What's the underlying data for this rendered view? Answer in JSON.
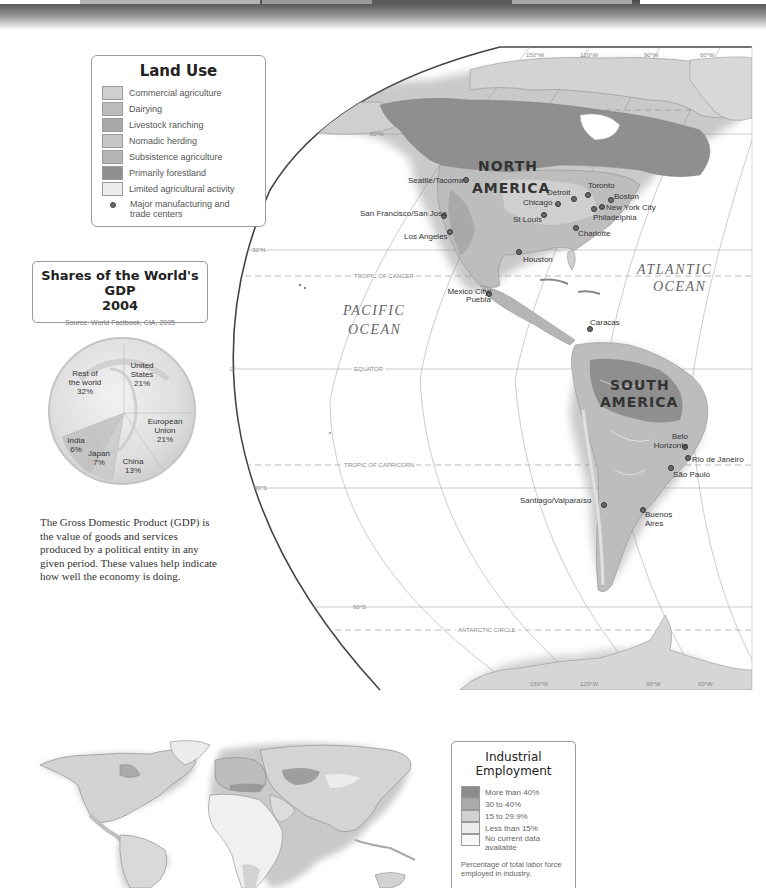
{
  "page": {
    "theme_colors": {
      "commercial_agriculture": "#cfcfcf",
      "dairying": "#bdbdbd",
      "livestock_ranching": "#a9a9a9",
      "nomadic_herding": "#c6c6c6",
      "subsistence_agriculture": "#b5b5b5",
      "primarily_forestland": "#8f8f8f",
      "limited_agricultural_activity": "#ececec",
      "city_marker": "#6b6b6b"
    }
  },
  "land_use_legend": {
    "title": "Land Use",
    "items": [
      {
        "label": "Commercial agriculture",
        "color": "#cfcfcf"
      },
      {
        "label": "Dairying",
        "color": "#bdbdbd"
      },
      {
        "label": "Livestock ranching",
        "color": "#a9a9a9"
      },
      {
        "label": "Nomadic herding",
        "color": "#c6c6c6"
      },
      {
        "label": "Subsistence agriculture",
        "color": "#b5b5b5"
      },
      {
        "label": "Primarily forestland",
        "color": "#8f8f8f"
      },
      {
        "label": "Limited agricultural activity",
        "color": "#ececec"
      }
    ],
    "marker_label": "Major manufacturing and trade centers"
  },
  "gdp": {
    "title_line1": "Shares of the World's GDP",
    "title_line2": "2004",
    "source": "Source: World Factbook, CIA, 2005",
    "paragraph": "The Gross Domestic Product (GDP) is the value of goods and services produced by a political entity in any given period. These values help indicate how well the economy is doing.",
    "slices": [
      {
        "name_line1": "Rest of",
        "name_line2": "the world",
        "value": "32%"
      },
      {
        "name_line1": "United",
        "name_line2": "States",
        "value": "21%"
      },
      {
        "name_line1": "European",
        "name_line2": "Union",
        "value": "21%"
      },
      {
        "name_line1": "China",
        "name_line2": "",
        "value": "13%"
      },
      {
        "name_line1": "Japan",
        "name_line2": "",
        "value": "7%"
      },
      {
        "name_line1": "India",
        "name_line2": "",
        "value": "6%"
      }
    ]
  },
  "map": {
    "continents": {
      "north_america_1": "NORTH",
      "north_america_2": "AMERICA",
      "south_america_1": "SOUTH",
      "south_america_2": "AMERICA"
    },
    "oceans": {
      "pacific_1": "PACIFIC",
      "pacific_2": "OCEAN",
      "atlantic_1": "ATLANTIC",
      "atlantic_2": "OCEAN"
    },
    "lines": {
      "lat_60n": "60°N",
      "lat_30n": "30°N",
      "lat_0": "0°",
      "lat_30s": "30°S",
      "lat_60s": "60°S",
      "tropic_cancer": "TROPIC OF CANCER",
      "equator": "EQUATOR",
      "tropic_capricorn": "TROPIC OF CAPRICORN",
      "antarctic_circle": "ANTARCTIC CIRCLE",
      "lon_150w": "150°W",
      "lon_120w": "120°W",
      "lon_90w": "90°W",
      "lon_60w": "60°W"
    },
    "cities": [
      {
        "name": "Seattle/Tacoma"
      },
      {
        "name": "San Francisco/San Jose"
      },
      {
        "name": "Los Angeles"
      },
      {
        "name": "Detroit"
      },
      {
        "name": "Chicago"
      },
      {
        "name": "St Louis"
      },
      {
        "name": "Toronto"
      },
      {
        "name": "Boston"
      },
      {
        "name": "New York City"
      },
      {
        "name": "Philadelphia"
      },
      {
        "name": "Charlotte"
      },
      {
        "name": "Houston"
      },
      {
        "name": "Mexico City/ Puebla"
      },
      {
        "name": "Caracas"
      },
      {
        "name": "Belo Horizonte"
      },
      {
        "name": "Rio de Janeiro"
      },
      {
        "name": "São Paulo"
      },
      {
        "name": "Santiago/Valparaíso"
      },
      {
        "name": "Buenos Aires"
      }
    ]
  },
  "industrial_legend": {
    "title_line1": "Industrial",
    "title_line2": "Employment",
    "items": [
      {
        "label": "More than 40%",
        "color": "#8c8c8c"
      },
      {
        "label": "30 to 40%",
        "color": "#aaaaaa"
      },
      {
        "label": "15 to 29.9%",
        "color": "#d2d2d2"
      },
      {
        "label": "Less than 15%",
        "color": "#ececec"
      },
      {
        "label": "No current data available",
        "color": "#f7f7f7"
      }
    ],
    "note": "Percentage of total labor force employed in industry."
  }
}
